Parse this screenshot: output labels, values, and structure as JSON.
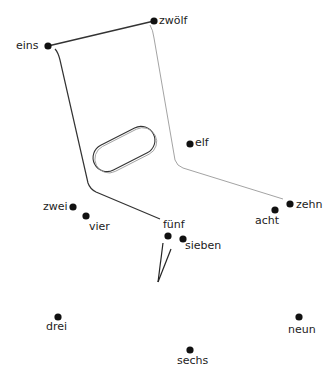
{
  "diagram": {
    "points": [
      {
        "id": "eins",
        "label": "eins",
        "x": 48,
        "y": 46,
        "lx": 16,
        "ly": 40
      },
      {
        "id": "zwoelf",
        "label": "zwölf",
        "x": 154,
        "y": 21,
        "lx": 159,
        "ly": 15
      },
      {
        "id": "elf",
        "label": "elf",
        "x": 190,
        "y": 144,
        "lx": 195,
        "ly": 137
      },
      {
        "id": "zwei",
        "label": "zwei",
        "x": 73,
        "y": 207,
        "lx": 43,
        "ly": 201
      },
      {
        "id": "vier",
        "label": "vier",
        "x": 86,
        "y": 216,
        "lx": 89,
        "ly": 221
      },
      {
        "id": "fuenf",
        "label": "fünf",
        "x": 168,
        "y": 236,
        "lx": 163,
        "ly": 219
      },
      {
        "id": "sieben",
        "label": "sieben",
        "x": 183,
        "y": 239,
        "lx": 185,
        "ly": 240
      },
      {
        "id": "zehn",
        "label": "zehn",
        "x": 290,
        "y": 204,
        "lx": 296,
        "ly": 199
      },
      {
        "id": "acht",
        "label": "acht",
        "x": 275,
        "y": 210,
        "lx": 255,
        "ly": 215
      },
      {
        "id": "drei",
        "label": "drei",
        "x": 58,
        "y": 317,
        "lx": 46,
        "ly": 321
      },
      {
        "id": "neun",
        "label": "neun",
        "x": 299,
        "y": 317,
        "lx": 288,
        "ly": 324
      },
      {
        "id": "sechs",
        "label": "sechs",
        "x": 190,
        "y": 350,
        "lx": 177,
        "ly": 355
      }
    ],
    "colors": {
      "dot": "#111111",
      "line_dark": "#333333",
      "line_light": "#888888",
      "text": "#222222"
    }
  }
}
